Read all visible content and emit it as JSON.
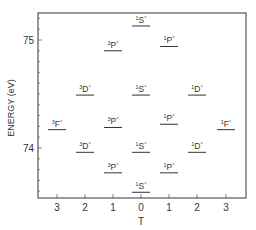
{
  "chart_data": {
    "type": "scatter",
    "title": "",
    "xlabel": "T",
    "ylabel": "ENERGY (eV)",
    "x_ticks": [
      "3",
      "2",
      "1",
      "0",
      "1",
      "2",
      "3"
    ],
    "y_ticks": [
      "74",
      "75"
    ],
    "ylim": [
      73.45,
      75.25
    ],
    "grid": false,
    "legend": null,
    "levels": [
      {
        "term": "¹S°",
        "sup": "1",
        "letter": "S",
        "col": 3,
        "energy": 75.13
      },
      {
        "term": "³P°",
        "sup": "3",
        "letter": "P",
        "col": 2,
        "energy": 74.9
      },
      {
        "term": "¹P°",
        "sup": "1",
        "letter": "P",
        "col": 4,
        "energy": 74.94
      },
      {
        "term": "³D°",
        "sup": "3",
        "letter": "D",
        "col": 1,
        "energy": 74.49
      },
      {
        "term": "¹S°",
        "sup": "1",
        "letter": "S",
        "col": 3,
        "energy": 74.49
      },
      {
        "term": "¹D°",
        "sup": "1",
        "letter": "D",
        "col": 5,
        "energy": 74.49
      },
      {
        "term": "³F°",
        "sup": "3",
        "letter": "F",
        "col": 0,
        "energy": 74.17
      },
      {
        "term": "³P°",
        "sup": "3",
        "letter": "P",
        "col": 2,
        "energy": 74.19
      },
      {
        "term": "¹P°",
        "sup": "1",
        "letter": "P",
        "col": 4,
        "energy": 74.22
      },
      {
        "term": "¹F°",
        "sup": "1",
        "letter": "F",
        "col": 6,
        "energy": 74.17
      },
      {
        "term": "³D°",
        "sup": "3",
        "letter": "D",
        "col": 1,
        "energy": 73.96
      },
      {
        "term": "¹S°",
        "sup": "1",
        "letter": "S",
        "col": 3,
        "energy": 73.96
      },
      {
        "term": "¹D°",
        "sup": "1",
        "letter": "D",
        "col": 5,
        "energy": 73.96
      },
      {
        "term": "³P°",
        "sup": "3",
        "letter": "P",
        "col": 2,
        "energy": 73.77
      },
      {
        "term": "¹P°",
        "sup": "1",
        "letter": "P",
        "col": 4,
        "energy": 73.77
      },
      {
        "term": "¹S°",
        "sup": "1",
        "letter": "S",
        "col": 3,
        "energy": 73.59
      }
    ]
  },
  "colors": {
    "ink": "#333333",
    "frame": "#555555"
  }
}
